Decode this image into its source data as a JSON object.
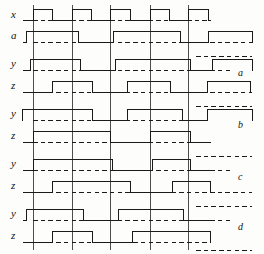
{
  "figure": {
    "type": "digital-timing-diagram",
    "width": 264,
    "height": 254,
    "background": "#fdfdfc",
    "ink": "#1a1a1a",
    "clock_label": "x",
    "input_label": "a"
  },
  "left_labels": [
    {
      "text": "x",
      "x": 11,
      "y": 9
    },
    {
      "text": "a",
      "x": 11,
      "y": 30
    },
    {
      "text": "y",
      "x": 11,
      "y": 58
    },
    {
      "text": "z",
      "x": 11,
      "y": 80
    },
    {
      "text": "y",
      "x": 11,
      "y": 108
    },
    {
      "text": "z",
      "x": 11,
      "y": 130
    },
    {
      "text": "y",
      "x": 11,
      "y": 158
    },
    {
      "text": "z",
      "x": 11,
      "y": 180
    },
    {
      "text": "y",
      "x": 11,
      "y": 208
    },
    {
      "text": "z",
      "x": 11,
      "y": 230
    }
  ],
  "right_labels": [
    {
      "text": "a",
      "x": 238,
      "y": 68
    },
    {
      "text": "b",
      "x": 238,
      "y": 120
    },
    {
      "text": "c",
      "x": 238,
      "y": 172
    },
    {
      "text": "d",
      "x": 238,
      "y": 222
    }
  ],
  "gridlines": {
    "x_positions": [
      33,
      72,
      110,
      150,
      188
    ],
    "y_top": 5,
    "y_bottom": 250,
    "color": "#3a3a3a",
    "width": 0.9
  },
  "axis": {
    "trace_left": 22,
    "trace_right": 210,
    "dash_left": 33,
    "dash_right": 252,
    "amplitude": 11
  },
  "chart_data": {
    "type": "line",
    "title": "",
    "xlabel": "",
    "ylabel": "",
    "clock_pulses": [
      {
        "start": 33,
        "end": 52
      },
      {
        "start": 72,
        "end": 91
      },
      {
        "start": 110,
        "end": 130
      },
      {
        "start": 150,
        "end": 169
      },
      {
        "start": 188,
        "end": 208
      }
    ],
    "signals": [
      {
        "name": "x",
        "label": "x",
        "row": 0,
        "baseline": 20,
        "intervals": [
          [
            33,
            52
          ],
          [
            72,
            91
          ],
          [
            110,
            130
          ],
          [
            150,
            169
          ],
          [
            188,
            208
          ]
        ]
      },
      {
        "name": "a",
        "label": "a",
        "row": 1,
        "baseline": 42,
        "intervals": [
          [
            26,
            78
          ],
          [
            113,
            180
          ],
          [
            208,
            252
          ]
        ]
      },
      {
        "name": "y_a",
        "label": "y",
        "group": "a",
        "row": 2,
        "baseline": 70,
        "intervals": [
          [
            30,
            80
          ],
          [
            115,
            190
          ],
          [
            212,
            252
          ]
        ]
      },
      {
        "name": "z_a",
        "label": "z",
        "group": "a",
        "row": 3,
        "baseline": 92,
        "intervals": [
          [
            52,
            92
          ],
          [
            127,
            170
          ],
          [
            207,
            250
          ]
        ]
      },
      {
        "name": "y_b",
        "label": "y",
        "group": "b",
        "row": 4,
        "baseline": 120,
        "intervals": [
          [
            22,
            92
          ],
          [
            127,
            182
          ],
          [
            207,
            252
          ]
        ]
      },
      {
        "name": "z_b",
        "label": "z",
        "group": "b",
        "row": 5,
        "baseline": 142,
        "intervals": [
          [
            33,
            110
          ],
          [
            150,
            190
          ]
        ]
      },
      {
        "name": "y_c",
        "label": "y",
        "group": "c",
        "row": 6,
        "baseline": 170,
        "intervals": [
          [
            33,
            112
          ],
          [
            152,
            190
          ]
        ]
      },
      {
        "name": "z_c",
        "label": "z",
        "group": "c",
        "row": 7,
        "baseline": 192,
        "intervals": [
          [
            52,
            130
          ],
          [
            172,
            210
          ]
        ]
      },
      {
        "name": "y_d",
        "label": "y",
        "group": "d",
        "row": 8,
        "baseline": 220,
        "intervals": [
          [
            26,
            83
          ],
          [
            118,
            183
          ]
        ]
      },
      {
        "name": "z_d",
        "label": "z",
        "group": "d",
        "row": 9,
        "baseline": 242,
        "intervals": [
          [
            52,
            92
          ],
          [
            132,
            210
          ]
        ]
      }
    ],
    "dashed_reference_lines": [
      {
        "y": 20,
        "x1": 33,
        "x2": 210
      },
      {
        "y": 42,
        "x1": 33,
        "x2": 252
      },
      {
        "y": 56,
        "x1": 196,
        "x2": 252
      },
      {
        "y": 70,
        "x1": 33,
        "x2": 232
      },
      {
        "y": 92,
        "x1": 33,
        "x2": 252
      },
      {
        "y": 106,
        "x1": 196,
        "x2": 252
      },
      {
        "y": 120,
        "x1": 33,
        "x2": 210
      },
      {
        "y": 142,
        "x1": 33,
        "x2": 210
      },
      {
        "y": 156,
        "x1": 196,
        "x2": 252
      },
      {
        "y": 170,
        "x1": 33,
        "x2": 232
      },
      {
        "y": 192,
        "x1": 33,
        "x2": 252
      },
      {
        "y": 206,
        "x1": 196,
        "x2": 252
      },
      {
        "y": 220,
        "x1": 33,
        "x2": 232
      },
      {
        "y": 242,
        "x1": 33,
        "x2": 210
      },
      {
        "y": 250,
        "x1": 196,
        "x2": 252
      }
    ]
  }
}
